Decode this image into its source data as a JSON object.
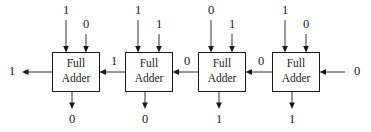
{
  "diagram": {
    "box_label_line1": "Full",
    "box_label_line2": "Adder",
    "stroke_color": "#1a1a1a",
    "background_color": "#ffffff",
    "adders": [
      {
        "index": 0,
        "position": "leftmost",
        "input_a": "1",
        "input_b": "0",
        "sum_out": "0",
        "carry_in": "1",
        "carry_out": "1"
      },
      {
        "index": 1,
        "position": "second",
        "input_a": "1",
        "input_b": "1",
        "sum_out": "0",
        "carry_in": "0",
        "carry_out": "1"
      },
      {
        "index": 2,
        "position": "third",
        "input_a": "0",
        "input_b": "1",
        "sum_out": "1",
        "carry_in": "0",
        "carry_out": "0"
      },
      {
        "index": 3,
        "position": "rightmost",
        "input_a": "1",
        "input_b": "0",
        "sum_out": "1",
        "carry_in": "0",
        "carry_out": "0"
      }
    ],
    "final_carry_out": "1",
    "initial_carry_in": "0",
    "carry_chain_labels": [
      "1",
      "0",
      "0"
    ],
    "top_input_labels": [
      "1",
      "0",
      "1",
      "1",
      "0",
      "1",
      "1",
      "0"
    ],
    "bottom_output_labels": [
      "0",
      "0",
      "1",
      "1"
    ]
  }
}
